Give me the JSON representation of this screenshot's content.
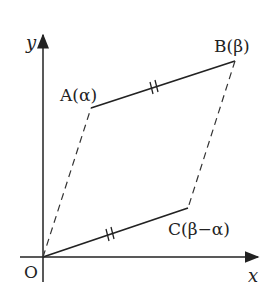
{
  "diagram": {
    "type": "complex-plane-parallelogram",
    "axes": {
      "x_label": "x",
      "y_label": "y",
      "origin_label": "O"
    },
    "points": [
      {
        "id": "O",
        "label": "O",
        "x": 43,
        "y": 257
      },
      {
        "id": "A",
        "label": "A(α)",
        "x": 91,
        "y": 108
      },
      {
        "id": "B",
        "label": "B(β)",
        "x": 235,
        "y": 61
      },
      {
        "id": "C",
        "label": "C(β−α)",
        "x": 188,
        "y": 208
      }
    ],
    "segments": [
      {
        "from": "A",
        "to": "B",
        "style": "solid",
        "tick_marks": 2
      },
      {
        "from": "O",
        "to": "C",
        "style": "solid",
        "tick_marks": 2
      },
      {
        "from": "O",
        "to": "A",
        "style": "dashed"
      },
      {
        "from": "B",
        "to": "C",
        "style": "dashed"
      }
    ],
    "colors": {
      "line": "#222222",
      "background": "#ffffff"
    }
  }
}
